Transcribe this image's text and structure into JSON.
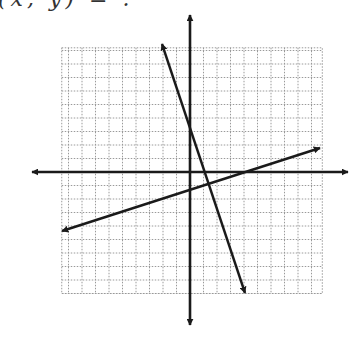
{
  "header": {
    "clipped_text": "(x, y) = ."
  },
  "graph": {
    "grid": {
      "x_min": -9.5,
      "x_max": 9.8,
      "y_min": -9,
      "y_max": 9.2,
      "cell_px": 13.5,
      "origin_px": [
        190,
        172
      ],
      "line_color": "#9a9a9a",
      "style": "dotted"
    },
    "axes": {
      "color": "#1a1a1a",
      "x_axis_px": {
        "x1": 32,
        "x2": 348,
        "y": 172
      },
      "y_axis_px": {
        "x": 190,
        "y1": 15,
        "y2": 325
      }
    },
    "lines": [
      {
        "name": "steep-line",
        "equation": "y = -3x + 3",
        "slope": -3,
        "intercept": 3,
        "from_px": [
          162,
          44
        ],
        "to_px": [
          245,
          293
        ]
      },
      {
        "name": "shallow-line",
        "equation": "y = (1/3)x - 1",
        "slope": 0.3333,
        "intercept": -1,
        "from_px": [
          62,
          231
        ],
        "to_px": [
          320,
          148
        ]
      }
    ],
    "intersection": {
      "x": 1.2,
      "y": -0.6
    }
  }
}
